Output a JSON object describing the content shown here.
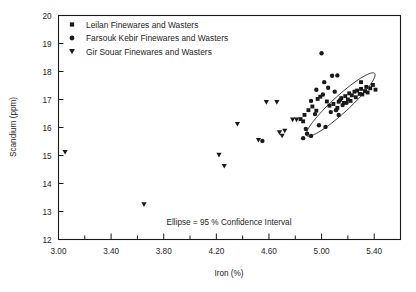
{
  "chart_data": {
    "type": "scatter",
    "title": "",
    "xlabel": "Iron (%)",
    "ylabel": "Scandium (ppm)",
    "xlim": [
      3.0,
      5.6
    ],
    "ylim": [
      12,
      20
    ],
    "x_major_ticks": [
      "3.00",
      "3.40",
      "3.80",
      "4.20",
      "4.60",
      "5.00",
      "5.40"
    ],
    "x_major_tick_values": [
      3.0,
      3.4,
      3.8,
      4.2,
      4.6,
      5.0,
      5.4
    ],
    "x_minor_tick_values": [
      3.2,
      3.6,
      4.0,
      4.4,
      4.8,
      5.2
    ],
    "y_ticks": [
      "12",
      "13",
      "14",
      "15",
      "16",
      "17",
      "18",
      "19",
      "20"
    ],
    "y_tick_values": [
      12,
      13,
      14,
      15,
      16,
      17,
      18,
      19,
      20
    ],
    "grid": false,
    "legend_position": "top-left",
    "annotation": "Ellipse = 95 % Confidence Interval",
    "ellipse": {
      "center_x": 5.145,
      "center_y": 16.82,
      "semi_major": 1.31,
      "semi_minor": 0.21,
      "angle_deg": -59.5,
      "label": "95 % Confidence Interval"
    },
    "series": [
      {
        "name": "Leilan Finewares and Wasters",
        "marker": "square",
        "color": "#1a1a1a",
        "points": [
          [
            5.04,
            16.93
          ],
          [
            5.06,
            16.78
          ],
          [
            5.09,
            16.84
          ],
          [
            5.12,
            16.7
          ],
          [
            5.13,
            16.92
          ],
          [
            5.15,
            17.05
          ],
          [
            5.17,
            16.88
          ],
          [
            5.18,
            17.12
          ],
          [
            5.2,
            17.0
          ],
          [
            5.21,
            17.22
          ],
          [
            5.22,
            16.95
          ],
          [
            5.23,
            17.15
          ],
          [
            5.25,
            17.28
          ],
          [
            5.26,
            17.08
          ],
          [
            5.27,
            17.32
          ],
          [
            5.29,
            17.2
          ],
          [
            5.3,
            17.38
          ],
          [
            5.31,
            17.18
          ],
          [
            5.33,
            17.3
          ],
          [
            5.34,
            17.45
          ],
          [
            5.35,
            17.25
          ],
          [
            5.37,
            17.4
          ],
          [
            5.39,
            17.52
          ],
          [
            5.41,
            17.35
          ],
          [
            5.3,
            17.62
          ],
          [
            4.93,
            16.75
          ],
          [
            4.96,
            16.6
          ],
          [
            4.9,
            16.62
          ],
          [
            4.87,
            16.45
          ],
          [
            4.84,
            16.3
          ],
          [
            4.86,
            16.22
          ],
          [
            4.97,
            17.02
          ],
          [
            4.99,
            17.1
          ]
        ]
      },
      {
        "name": "Farsouk Kebir Finewares and Wasters",
        "marker": "circle",
        "color": "#1a1a1a",
        "points": [
          [
            5.0,
            18.65
          ],
          [
            5.08,
            17.85
          ],
          [
            5.12,
            17.86
          ],
          [
            5.02,
            17.62
          ],
          [
            5.05,
            17.42
          ],
          [
            4.96,
            17.35
          ],
          [
            5.1,
            17.28
          ],
          [
            5.01,
            17.18
          ],
          [
            4.92,
            16.95
          ],
          [
            5.14,
            16.98
          ],
          [
            5.16,
            16.8
          ],
          [
            5.19,
            16.88
          ],
          [
            4.95,
            16.48
          ],
          [
            4.98,
            16.08
          ],
          [
            5.03,
            16.02
          ],
          [
            4.89,
            15.78
          ],
          [
            4.92,
            15.7
          ],
          [
            4.86,
            15.62
          ],
          [
            4.88,
            15.95
          ],
          [
            4.55,
            15.52
          ],
          [
            5.07,
            16.55
          ],
          [
            5.11,
            16.62
          ],
          [
            5.13,
            16.45
          ]
        ]
      },
      {
        "name": "Gir Souar Finewares and Wasters",
        "marker": "triangle-down",
        "color": "#1a1a1a",
        "points": [
          [
            3.05,
            15.12
          ],
          [
            3.65,
            13.25
          ],
          [
            4.26,
            14.62
          ],
          [
            4.22,
            15.02
          ],
          [
            4.58,
            16.9
          ],
          [
            4.66,
            16.9
          ],
          [
            4.78,
            16.28
          ],
          [
            4.81,
            16.28
          ],
          [
            4.36,
            16.12
          ],
          [
            4.68,
            15.82
          ],
          [
            4.72,
            15.88
          ],
          [
            4.7,
            15.7
          ],
          [
            4.52,
            15.55
          ]
        ]
      }
    ]
  },
  "legend": {
    "items": [
      {
        "marker": "square",
        "label": "Leilan Finewares and Wasters"
      },
      {
        "marker": "circle",
        "label": "Farsouk Kebir Finewares and Wasters"
      },
      {
        "marker": "triangle-down",
        "label": "Gir Souar Finewares and Wasters"
      }
    ]
  }
}
